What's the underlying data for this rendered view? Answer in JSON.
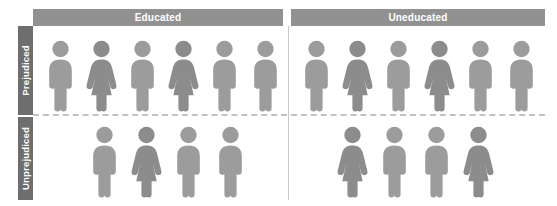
{
  "chart_data": {
    "type": "pictogram",
    "title": "",
    "column_headers": [
      "Educated",
      "Uneducated"
    ],
    "row_headers": [
      "Prejudiced",
      "Unprejudiced"
    ],
    "unit": "1 icon = 1 person",
    "legend": [
      {
        "name": "male-figure-icon",
        "label": "male",
        "color": "#9c9c9c"
      },
      {
        "name": "female-figure-icon",
        "label": "female",
        "color": "#8c8c8c"
      }
    ],
    "cells": [
      {
        "row": "Prejudiced",
        "column": "Educated",
        "count": 6,
        "figures": [
          "male",
          "female",
          "male",
          "female",
          "male",
          "male"
        ]
      },
      {
        "row": "Prejudiced",
        "column": "Uneducated",
        "count": 6,
        "figures": [
          "male",
          "female",
          "male",
          "female",
          "male",
          "male"
        ]
      },
      {
        "row": "Unprejudiced",
        "column": "Educated",
        "count": 4,
        "figures": [
          "male",
          "female",
          "male",
          "male"
        ]
      },
      {
        "row": "Unprejudiced",
        "column": "Uneducated",
        "count": 4,
        "figures": [
          "female",
          "male",
          "male",
          "female"
        ]
      }
    ]
  },
  "colors": {
    "header_bar": "#919191",
    "row_label_bar": "#6e6e6e",
    "header_text": "#ffffff",
    "male": "#9c9c9c",
    "female": "#8c8c8c",
    "divider": "#c9c9c9",
    "dashed_divider": "#c2c2c2",
    "background": "#ffffff"
  }
}
